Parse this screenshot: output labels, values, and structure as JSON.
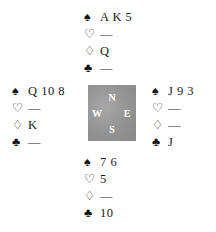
{
  "diagram": {
    "kind": "bridge-hand-diagram",
    "background_color": "#ffffff",
    "text_color": "#1a1a1a"
  },
  "suit_symbols": {
    "spade": "♠",
    "heart": "♡",
    "diamond": "♢",
    "club": "♣"
  },
  "void_marker": "—",
  "compass": {
    "north": "N",
    "west": "W",
    "east": "E",
    "south": "S",
    "box_color": "#9b9b9b",
    "label_color": "#ffffff"
  },
  "hands": {
    "north": {
      "position": "North",
      "spades": "A K 5",
      "hearts": "—",
      "diamonds": "Q",
      "clubs": "—"
    },
    "west": {
      "position": "West",
      "spades": "Q 10 8",
      "hearts": "—",
      "diamonds": "K",
      "clubs": "—"
    },
    "east": {
      "position": "East",
      "spades": "J 9 3",
      "hearts": "—",
      "diamonds": "—",
      "clubs": "J"
    },
    "south": {
      "position": "South",
      "spades": "7 6",
      "hearts": "5",
      "diamonds": "—",
      "clubs": "10"
    }
  }
}
